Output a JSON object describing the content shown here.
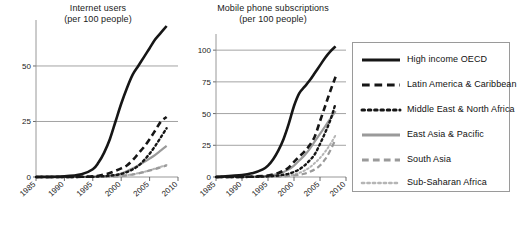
{
  "charts": [
    {
      "id": "internet",
      "title_line1": "Internet users",
      "title_line2": "(per 100 people)"
    },
    {
      "id": "mobile",
      "title_line1": "Mobile phone subscriptions",
      "title_line2": "(per 100 people)"
    }
  ],
  "legend": {
    "items": [
      {
        "label": "High income OECD",
        "style": "solid",
        "color": "#161616",
        "width": 2.6
      },
      {
        "label": "Latin America & Caribbean",
        "style": "dashed",
        "color": "#161616",
        "width": 2.6
      },
      {
        "label": "Middle East & North Africa",
        "style": "dotted",
        "color": "#161616",
        "width": 2.4
      },
      {
        "label": "East Asia & Pacific",
        "style": "solid",
        "color": "#9a9a9a",
        "width": 2.2
      },
      {
        "label": "South Asia",
        "style": "dashed",
        "color": "#9a9a9a",
        "width": 2.2
      },
      {
        "label": "Sub-Saharan Africa",
        "style": "dotted",
        "color": "#b5b5b5",
        "width": 2.0
      }
    ]
  },
  "chart_data": [
    {
      "type": "line",
      "title": "Internet users (per 100 people)",
      "xlabel": "",
      "ylabel": "per 100 people",
      "xticks": [
        "1985",
        "1990",
        "1995",
        "2000",
        "2005",
        "2010"
      ],
      "yticks": [
        0,
        25,
        50
      ],
      "xlim": [
        1985,
        2010
      ],
      "ylim": [
        0,
        68
      ],
      "grid": true,
      "legend_position": "right-outside",
      "x": [
        1985,
        1990,
        1993,
        1995,
        1996,
        1997,
        1998,
        1999,
        2000,
        2001,
        2002,
        2003,
        2004,
        2005,
        2006,
        2007,
        2008
      ],
      "series": [
        {
          "name": "High income OECD",
          "values": [
            0,
            0.3,
            1.2,
            3.5,
            6.5,
            11,
            17,
            25,
            33,
            40,
            46,
            50,
            54,
            58,
            62,
            65,
            68
          ]
        },
        {
          "name": "Latin America & Caribbean",
          "values": [
            0,
            0,
            0.1,
            0.3,
            0.6,
            1.1,
            1.8,
            2.8,
            3.9,
            5.2,
            7.5,
            10.5,
            13.5,
            17,
            21,
            25,
            27
          ]
        },
        {
          "name": "Middle East & North Africa",
          "values": [
            0,
            0,
            0.05,
            0.1,
            0.2,
            0.35,
            0.6,
            0.9,
            1.4,
            2.2,
            3.4,
            5.0,
            7.5,
            10.5,
            14,
            18,
            22
          ]
        },
        {
          "name": "East Asia & Pacific",
          "values": [
            0,
            0,
            0.05,
            0.1,
            0.2,
            0.3,
            0.5,
            0.9,
            1.6,
            2.6,
            3.8,
            5.2,
            6.7,
            8.3,
            10,
            12,
            14
          ]
        },
        {
          "name": "South Asia",
          "values": [
            0,
            0,
            0,
            0.02,
            0.04,
            0.08,
            0.15,
            0.25,
            0.4,
            0.7,
            1.1,
            1.6,
            2.2,
            2.9,
            3.6,
            4.4,
            5.2
          ]
        },
        {
          "name": "Sub-Saharan Africa",
          "values": [
            0,
            0,
            0,
            0.02,
            0.04,
            0.08,
            0.15,
            0.3,
            0.5,
            0.8,
            1.2,
            1.7,
            2.3,
            3.0,
            3.8,
            4.6,
            5.4
          ]
        }
      ]
    },
    {
      "type": "line",
      "title": "Mobile phone subscriptions (per 100 people)",
      "xlabel": "",
      "ylabel": "per 100 people",
      "xticks": [
        "1985",
        "1990",
        "1995",
        "2000",
        "2005",
        "2010"
      ],
      "yticks": [
        0,
        25,
        50,
        75,
        100
      ],
      "xlim": [
        1985,
        2010
      ],
      "ylim": [
        0,
        108
      ],
      "grid": true,
      "legend_position": "right-outside",
      "x": [
        1985,
        1990,
        1992,
        1994,
        1995,
        1996,
        1997,
        1998,
        1999,
        2000,
        2001,
        2002,
        2003,
        2004,
        2005,
        2006,
        2007,
        2008
      ],
      "series": [
        {
          "name": "High income OECD",
          "values": [
            0,
            1.5,
            3,
            6,
            9,
            14,
            21,
            30,
            42,
            56,
            66,
            71,
            76,
            82,
            88,
            94,
            99,
            103
          ]
        },
        {
          "name": "Latin America & Caribbean",
          "values": [
            0,
            0.1,
            0.3,
            0.8,
            1.2,
            2,
            3.2,
            5,
            7.5,
            12,
            16,
            20,
            25,
            32,
            44,
            56,
            68,
            79
          ]
        },
        {
          "name": "Middle East & North Africa",
          "values": [
            0,
            0.05,
            0.1,
            0.3,
            0.5,
            0.8,
            1.2,
            1.8,
            2.6,
            4,
            6,
            9,
            13,
            18,
            26,
            35,
            45,
            58
          ]
        },
        {
          "name": "East Asia & Pacific",
          "values": [
            0,
            0.1,
            0.2,
            0.5,
            0.9,
            1.6,
            2.6,
            4,
            6,
            9,
            13,
            17,
            22,
            28,
            34,
            40,
            46,
            52
          ]
        },
        {
          "name": "South Asia",
          "values": [
            0,
            0,
            0.02,
            0.05,
            0.1,
            0.2,
            0.3,
            0.5,
            0.8,
            1.2,
            1.8,
            2.6,
            4,
            6,
            9,
            14,
            21,
            30
          ]
        },
        {
          "name": "Sub-Saharan Africa",
          "values": [
            0,
            0,
            0.02,
            0.05,
            0.1,
            0.2,
            0.4,
            0.7,
            1.2,
            2,
            3.2,
            5,
            7.5,
            11,
            15,
            20,
            26,
            33
          ]
        }
      ]
    }
  ]
}
